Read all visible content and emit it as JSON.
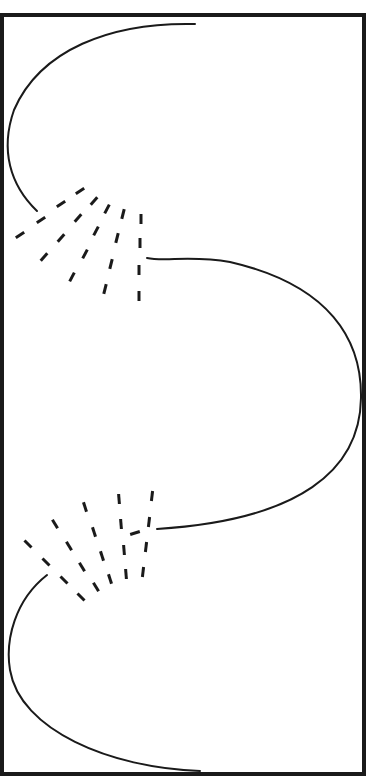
{
  "figure": {
    "colors": {
      "ink": "#1a1a1a",
      "background": "#ffffff"
    },
    "frame": {
      "x": 2,
      "y": 15,
      "w": 362,
      "h": 759,
      "stroke_width": 4
    },
    "curves": [
      {
        "name": "top-curve",
        "d": "M195,24 C110,22 40,50 14,110 C0,150 10,185 37,211"
      },
      {
        "name": "middle-curve",
        "d": "M147,258 C165,262 190,255 230,262 C330,285 362,340 361,398 C360,470 300,520 157,529"
      },
      {
        "name": "bottom-curve",
        "d": "M47,575 C15,600 5,640 10,670 C20,730 110,768 200,771"
      }
    ],
    "fans": [
      {
        "name": "upper-fan",
        "dashes": [
          [
            80,
            191,
            -33
          ],
          [
            61,
            204,
            -33
          ],
          [
            41,
            220,
            -33
          ],
          [
            20,
            235,
            -33
          ],
          [
            94,
            201,
            -48
          ],
          [
            78,
            218,
            -48
          ],
          [
            61,
            238,
            -48
          ],
          [
            44,
            257,
            -48
          ],
          [
            107,
            209,
            -62
          ],
          [
            96,
            231,
            -62
          ],
          [
            85,
            254,
            -62
          ],
          [
            72,
            277,
            -62
          ],
          [
            123,
            214,
            -76
          ],
          [
            117,
            238,
            -76
          ],
          [
            111,
            264,
            -76
          ],
          [
            105,
            289,
            -76
          ],
          [
            141,
            219,
            -90
          ],
          [
            140,
            243,
            -90
          ],
          [
            139,
            270,
            -90
          ],
          [
            139,
            296,
            -90
          ]
        ]
      },
      {
        "name": "lower-fan",
        "dashes": [
          [
            28,
            544,
            45
          ],
          [
            46,
            562,
            45
          ],
          [
            64,
            580,
            45
          ],
          [
            81,
            597,
            45
          ],
          [
            55,
            524,
            58
          ],
          [
            69,
            546,
            58
          ],
          [
            82,
            567,
            58
          ],
          [
            96,
            587,
            58
          ],
          [
            85,
            507,
            72
          ],
          [
            94,
            532,
            72
          ],
          [
            102,
            556,
            72
          ],
          [
            110,
            579,
            72
          ],
          [
            119,
            499,
            85
          ],
          [
            121,
            524,
            85
          ],
          [
            124,
            550,
            85
          ],
          [
            126,
            574,
            85
          ],
          [
            152,
            496,
            97
          ],
          [
            149,
            522,
            97
          ],
          [
            146,
            547,
            97
          ],
          [
            143,
            572,
            97
          ],
          [
            135,
            533,
            -18
          ]
        ]
      }
    ]
  }
}
